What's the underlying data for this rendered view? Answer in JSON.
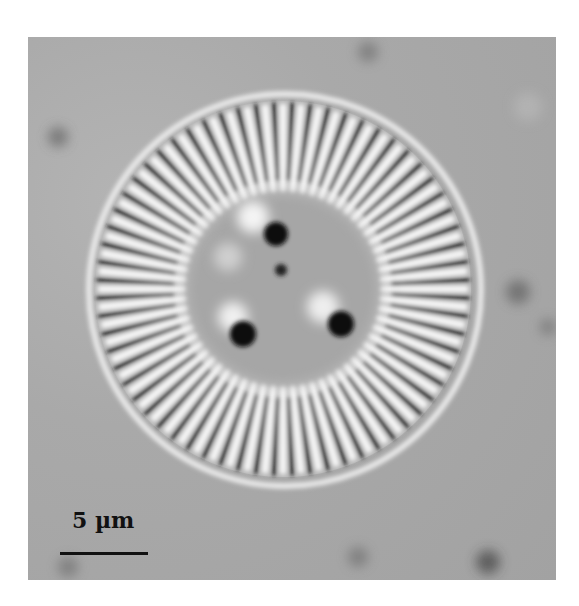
{
  "image": {
    "subject": "centric diatom valve (light micrograph)",
    "background_color": "#a9a9a9"
  },
  "scale_bar": {
    "label": "5 µm",
    "color": "#111111"
  }
}
